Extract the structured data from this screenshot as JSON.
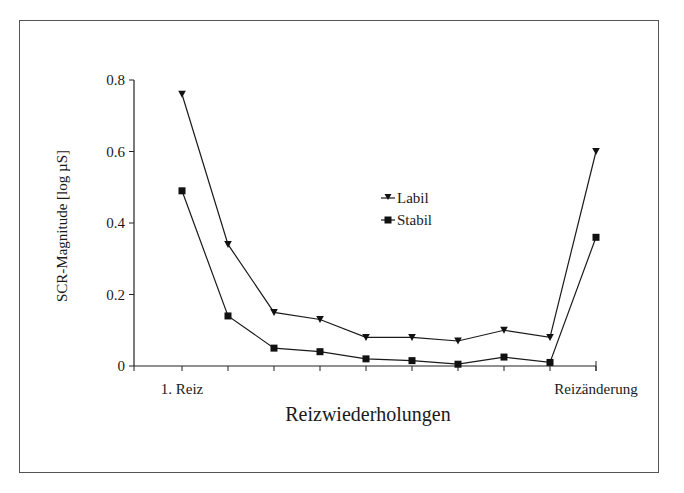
{
  "chart_data": {
    "type": "line",
    "title": "",
    "xlabel": "Reizwiederholungen",
    "ylabel": "SCR-Magnitude [log µS]",
    "x": [
      1,
      2,
      3,
      4,
      5,
      6,
      7,
      8,
      9,
      10
    ],
    "x_tick_labels": [
      {
        "position": 1,
        "label": "1. Reiz"
      },
      {
        "position": 10,
        "label": "Reizänderung"
      }
    ],
    "y_ticks": [
      0,
      0.2,
      0.4,
      0.6,
      0.8
    ],
    "y_tick_labels": [
      "0",
      "0.2",
      "0.4",
      "0.6",
      "0.8"
    ],
    "ylim": [
      0,
      0.8
    ],
    "grid": false,
    "legend_position": "center",
    "series": [
      {
        "name": "Labil",
        "marker": "triangle-down",
        "color": "#1a1a1a",
        "values": [
          0.76,
          0.34,
          0.15,
          0.13,
          0.08,
          0.08,
          0.07,
          0.1,
          0.08,
          0.6
        ]
      },
      {
        "name": "Stabil",
        "marker": "square",
        "color": "#1a1a1a",
        "values": [
          0.49,
          0.14,
          0.05,
          0.04,
          0.02,
          0.015,
          0.005,
          0.025,
          0.01,
          0.36
        ]
      }
    ]
  },
  "legend": {
    "items": [
      {
        "label": "Labil",
        "marker": "triangle-down-icon"
      },
      {
        "label": "Stabil",
        "marker": "square-icon"
      }
    ]
  }
}
